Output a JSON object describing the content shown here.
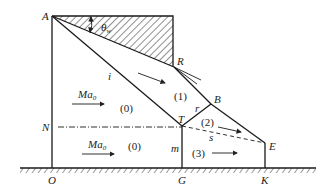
{
  "diagram": {
    "points": {
      "A": "A",
      "R": "R",
      "B": "B",
      "T": "T",
      "E": "E",
      "N": "N",
      "O": "O",
      "G": "G",
      "K": "K"
    },
    "lines": {
      "incident_shock": "i",
      "reflected_shock": "r",
      "slip_line": "s",
      "mach_stem": "m"
    },
    "angle": {
      "symbol": "θ",
      "subscript": "w"
    },
    "regions": {
      "upper_freestream": "(0)",
      "lower_freestream": "(0)",
      "region1": "(1)",
      "region2": "(2)",
      "region3": "(3)"
    },
    "mach": {
      "symbol": "Ma",
      "subscript": "0"
    }
  }
}
